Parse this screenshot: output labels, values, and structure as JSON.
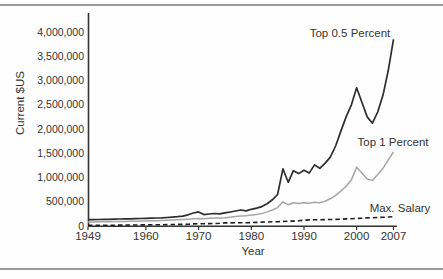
{
  "chart_data": {
    "type": "line",
    "title": "",
    "xlabel": "Year",
    "ylabel": "Current $US",
    "x_range": [
      1949,
      2007
    ],
    "ylim": [
      0,
      4000000
    ],
    "grid": false,
    "legend_position": "inline-annotations",
    "x": [
      1949,
      1950,
      1951,
      1952,
      1953,
      1954,
      1955,
      1956,
      1957,
      1958,
      1959,
      1960,
      1961,
      1962,
      1963,
      1964,
      1965,
      1966,
      1967,
      1968,
      1969,
      1970,
      1971,
      1972,
      1973,
      1974,
      1975,
      1976,
      1977,
      1978,
      1979,
      1980,
      1981,
      1982,
      1983,
      1984,
      1985,
      1986,
      1987,
      1988,
      1989,
      1990,
      1991,
      1992,
      1993,
      1994,
      1995,
      1996,
      1997,
      1998,
      1999,
      2000,
      2001,
      2002,
      2003,
      2004,
      2005,
      2006,
      2007
    ],
    "series": [
      {
        "name": "Max. Salary",
        "color": "#1f1f1f",
        "dash": "4.5 3",
        "width": 1.6,
        "values": [
          15000,
          15000,
          16000,
          16000,
          17000,
          17000,
          18000,
          19000,
          20000,
          21000,
          22000,
          23000,
          24000,
          26000,
          27000,
          29000,
          30000,
          32000,
          34000,
          36000,
          43000,
          45000,
          47000,
          50000,
          52000,
          55000,
          63000,
          64000,
          66000,
          68000,
          69000,
          70000,
          74000,
          80000,
          82000,
          86000,
          88000,
          92000,
          99000,
          101000,
          107000,
          120000,
          125000,
          127000,
          129000,
          131000,
          133000,
          137000,
          141000,
          146000,
          151000,
          157000,
          161000,
          166000,
          171000,
          175000,
          180000,
          186000,
          191000
        ]
      },
      {
        "name": "Top 1 Percent",
        "color": "#a6a6a6",
        "dash": null,
        "width": 1.5,
        "values": [
          82000,
          84000,
          86000,
          87000,
          89000,
          90000,
          92000,
          94000,
          96000,
          98000,
          101000,
          104000,
          107000,
          110000,
          113000,
          117000,
          122000,
          127000,
          133000,
          140000,
          148000,
          152000,
          150000,
          158000,
          164000,
          166000,
          172000,
          182000,
          193000,
          205000,
          212000,
          225000,
          240000,
          260000,
          290000,
          330000,
          380000,
          500000,
          440000,
          480000,
          465000,
          480000,
          470000,
          490000,
          480000,
          510000,
          560000,
          630000,
          720000,
          820000,
          950000,
          1210000,
          1090000,
          970000,
          940000,
          1060000,
          1190000,
          1360000,
          1530000
        ]
      },
      {
        "name": "Top 0.5 Percent",
        "color": "#2e2e2e",
        "dash": null,
        "width": 1.7,
        "values": [
          130000,
          132000,
          135000,
          137000,
          139000,
          141000,
          144000,
          147000,
          149000,
          151000,
          154000,
          157000,
          160000,
          164000,
          168000,
          175000,
          183000,
          192000,
          204000,
          230000,
          268000,
          290000,
          235000,
          248000,
          258000,
          252000,
          270000,
          288000,
          310000,
          330000,
          312000,
          345000,
          370000,
          400000,
          460000,
          540000,
          650000,
          1180000,
          900000,
          1140000,
          1080000,
          1150000,
          1090000,
          1260000,
          1190000,
          1290000,
          1420000,
          1650000,
          1950000,
          2250000,
          2500000,
          2850000,
          2550000,
          2250000,
          2120000,
          2350000,
          2700000,
          3200000,
          3850000
        ]
      }
    ],
    "y_ticks": [
      {
        "v": 0,
        "label": "0"
      },
      {
        "v": 500000,
        "label": "500,000"
      },
      {
        "v": 1000000,
        "label": "1,000,000"
      },
      {
        "v": 1500000,
        "label": "1,500,000"
      },
      {
        "v": 2000000,
        "label": "2,000,000"
      },
      {
        "v": 2500000,
        "label": "2,500,000"
      },
      {
        "v": 3000000,
        "label": "3,000,000"
      },
      {
        "v": 3500000,
        "label": "3,500,000"
      },
      {
        "v": 4000000,
        "label": "4,000,000"
      }
    ],
    "x_ticks": [
      {
        "v": 1949,
        "label": "1949"
      },
      {
        "v": 1960,
        "label": "1960"
      },
      {
        "v": 1970,
        "label": "1970"
      },
      {
        "v": 1980,
        "label": "1980"
      },
      {
        "v": 1990,
        "label": "1990"
      },
      {
        "v": 2000,
        "label": "2000"
      },
      {
        "v": 2007,
        "label": "2007"
      }
    ],
    "annotations": [
      {
        "text": "Top 0.5 Percent",
        "series": "Top 0.5 Percent"
      },
      {
        "text": "Top 1 Percent",
        "series": "Top 1 Percent"
      },
      {
        "text": "Max. Salary",
        "series": "Max. Salary"
      }
    ],
    "colors": {
      "axis": "#333333",
      "text": "#333333",
      "divider_rules": "#9a9a9a",
      "background": "#fefefe"
    }
  }
}
